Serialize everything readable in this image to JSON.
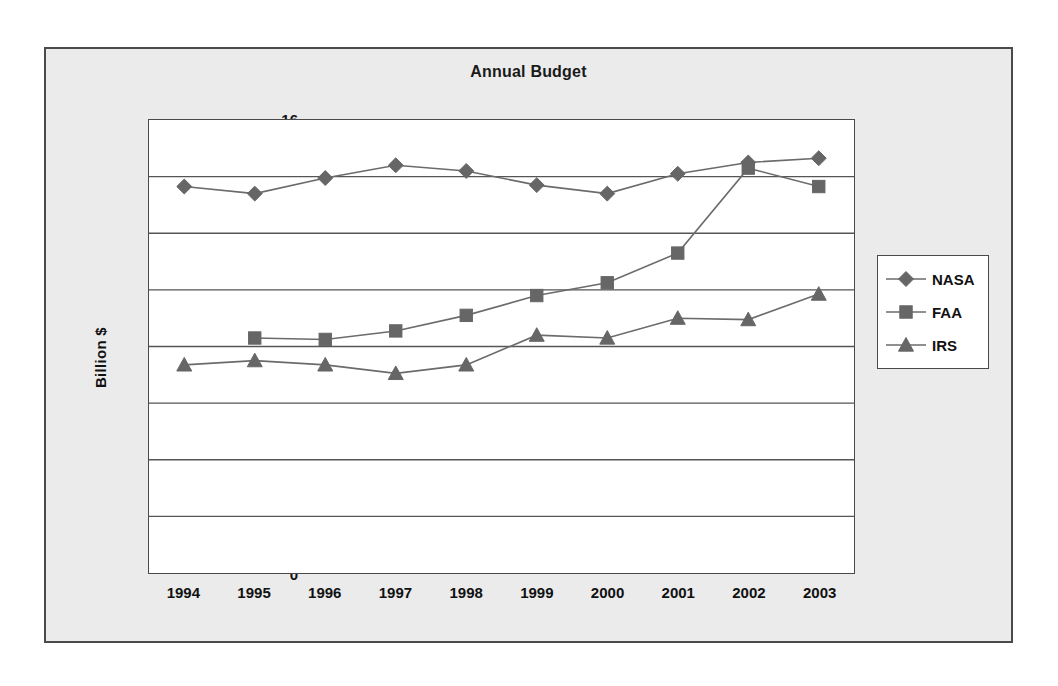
{
  "chart_data": {
    "type": "line",
    "title": "Annual Budget",
    "xlabel": "",
    "ylabel": "Billion $",
    "categories": [
      "1994",
      "1995",
      "1996",
      "1997",
      "1998",
      "1999",
      "2000",
      "2001",
      "2002",
      "2003"
    ],
    "x": [
      1994,
      1995,
      1996,
      1997,
      1998,
      1999,
      2000,
      2001,
      2002,
      2003
    ],
    "ylim": [
      0,
      16
    ],
    "yticks": [
      0,
      2,
      4,
      6,
      8,
      10,
      12,
      14,
      16
    ],
    "ytick_labels": [
      "0",
      "2",
      "4",
      "6",
      "8",
      "10",
      "12",
      "14",
      "16"
    ],
    "grid": "horizontal",
    "legend_position": "right",
    "series": [
      {
        "name": "NASA",
        "marker": "diamond",
        "color": "#666666",
        "values": [
          13.65,
          13.4,
          13.95,
          14.4,
          14.2,
          13.7,
          13.4,
          14.1,
          14.5,
          14.65
        ]
      },
      {
        "name": "FAA",
        "marker": "square",
        "color": "#666666",
        "values": [
          null,
          8.3,
          8.25,
          8.55,
          9.1,
          9.8,
          10.25,
          11.3,
          14.3,
          13.65
        ]
      },
      {
        "name": "IRS",
        "marker": "triangle",
        "color": "#666666",
        "values": [
          7.35,
          7.5,
          7.35,
          7.05,
          7.35,
          8.4,
          8.3,
          9.0,
          8.95,
          9.85
        ]
      }
    ]
  },
  "figure": {
    "background_color": "#ebebeb",
    "plot_background_color": "#ffffff",
    "border_color": "#4a4a4a",
    "gridline_color": "#555555",
    "marker_color": "#666666",
    "line_color": "#6b6b6b"
  },
  "legend": {
    "entries": [
      {
        "label": "NASA",
        "marker": "diamond"
      },
      {
        "label": "FAA",
        "marker": "square"
      },
      {
        "label": "IRS",
        "marker": "triangle"
      }
    ]
  }
}
